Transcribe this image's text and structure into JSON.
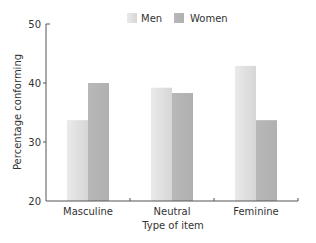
{
  "chart_data": {
    "type": "bar",
    "title": "",
    "xlabel": "Type of item",
    "ylabel": "Percentage conforming",
    "categories": [
      "Masculine",
      "Neutral",
      "Feminine"
    ],
    "series": [
      {
        "name": "Men",
        "values": [
          33.7,
          39.2,
          42.9
        ],
        "color": "#dcdcdc"
      },
      {
        "name": "Women",
        "values": [
          40.0,
          38.3,
          33.7
        ],
        "color": "#b5b5b5"
      }
    ],
    "ylim": [
      20,
      50
    ],
    "yticks": [
      20,
      30,
      40,
      50
    ],
    "ytick_labels": [
      "20",
      "30",
      "40",
      "50"
    ],
    "grid": false,
    "legend_position": "top-center"
  }
}
